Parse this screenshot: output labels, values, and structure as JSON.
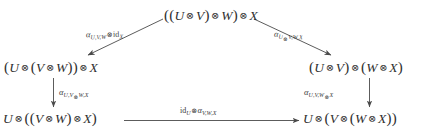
{
  "diagram": {
    "kind": "commutative-diagram",
    "shape": "pentagon",
    "background_color": "#ffffff",
    "text_color": "#2f2f2f",
    "tensor_symbol": "⊗",
    "nodes": [
      {
        "id": "top",
        "label": "((U ⊗ V) ⊗ W) ⊗ X",
        "position": "top-center"
      },
      {
        "id": "left",
        "label": "(U ⊗ (V ⊗ W)) ⊗ X",
        "position": "middle-left"
      },
      {
        "id": "right",
        "label": "(U ⊗ V) ⊗ (W ⊗ X)",
        "position": "middle-right"
      },
      {
        "id": "bottom-left",
        "label": "U ⊗ ((V ⊗ W) ⊗ X)",
        "position": "bottom-left"
      },
      {
        "id": "bottom-right",
        "label": "U ⊗ (V ⊗ (W ⊗ X))",
        "position": "bottom-right"
      }
    ],
    "edges": [
      {
        "id": "top-left-edge",
        "from": "top",
        "to": "left",
        "direction": "down-left-diagonal",
        "label": "α_{U,V,W} ⊗ id_X",
        "label_parts": {
          "alpha": "α",
          "alpha_subscript": "U,V,W",
          "tensor": "⊗",
          "identity": "id",
          "identity_subscript": "X"
        }
      },
      {
        "id": "top-right-edge",
        "from": "top",
        "to": "right",
        "direction": "down-right-diagonal",
        "label": "α_{U⊗V,W,X}",
        "label_parts": {
          "alpha": "α",
          "alpha_subscript": "U⊗V,W,X"
        }
      },
      {
        "id": "left-vertical-edge",
        "from": "left",
        "to": "bottom-left",
        "direction": "down",
        "label": "α_{U,V⊗W,X}",
        "label_parts": {
          "alpha": "α",
          "alpha_subscript": "U,V⊗W,X"
        }
      },
      {
        "id": "right-vertical-edge",
        "from": "right",
        "to": "bottom-right",
        "direction": "down",
        "label": "α_{U,V,W⊗X}",
        "label_parts": {
          "alpha": "α",
          "alpha_subscript": "U,V,W⊗X"
        }
      },
      {
        "id": "bottom-horizontal-edge",
        "from": "bottom-left",
        "to": "bottom-right",
        "direction": "right",
        "label": "id_U ⊗ α_{V,W,X}",
        "label_parts": {
          "identity": "id",
          "identity_subscript": "U",
          "tensor": "⊗",
          "alpha": "α",
          "alpha_subscript": "V,W,X"
        }
      }
    ],
    "objects": [
      "U",
      "V",
      "W",
      "X"
    ]
  }
}
